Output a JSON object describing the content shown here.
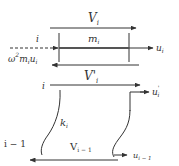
{
  "diagram": {
    "type": "free-body diagram (lumped mass-spring story)",
    "top_element": {
      "shear_top": {
        "base": "V",
        "sub": "i"
      },
      "mass": {
        "base": "m",
        "sub": "i"
      },
      "node_label": "i",
      "inertia_force": {
        "text": "ω",
        "sup": "2",
        "rest": "m",
        "rest_sub": "i",
        "rest2": "u",
        "rest2_sub": "i"
      },
      "displacement": {
        "base": "u",
        "sub": "i"
      },
      "shear_bottom": {
        "base": "V'",
        "sub": "i"
      }
    },
    "bottom_element": {
      "node_top_label": "i",
      "displacement_top": {
        "base": "u",
        "sub": "i",
        "sup": "'"
      },
      "spring": {
        "base": "k",
        "sub": "i"
      },
      "node_bottom_label": "i − 1",
      "shear": {
        "base": "V",
        "sub": "i − 1"
      },
      "displacement_bottom": {
        "base": "u",
        "sub": "i − 1"
      }
    },
    "colors": {
      "line": "#333333",
      "mass_bar": "#555555"
    }
  }
}
